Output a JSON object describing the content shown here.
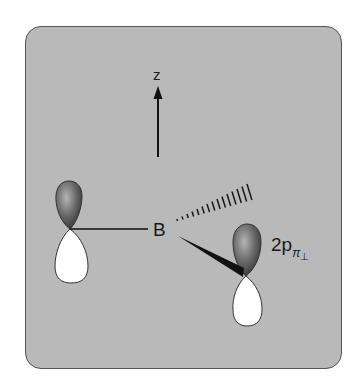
{
  "diagram": {
    "axis_label": "z",
    "atom_label": "B",
    "orbital_label": {
      "main": "2p",
      "subscript": "π",
      "sub_subscript": "⊥"
    }
  },
  "colors": {
    "panel_background": "#b9b9b9",
    "panel_border": "#555555",
    "lobe_shaded": "#5a5a5a",
    "lobe_white": "#ffffff",
    "bond": "#111111"
  }
}
